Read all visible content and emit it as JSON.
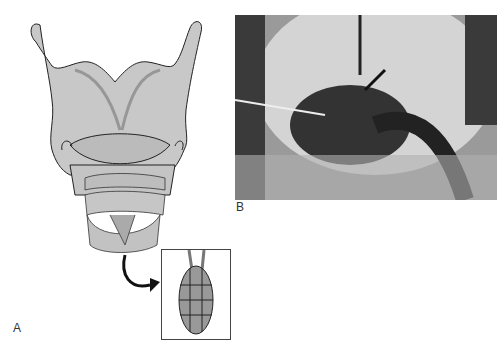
{
  "figure": {
    "panels": [
      {
        "label": "A",
        "description": "Line drawing of larynx (anterior view) with inset showing sutured graft"
      },
      {
        "label": "B",
        "description": "Intraoperative photograph with arrow and pointer"
      }
    ]
  }
}
